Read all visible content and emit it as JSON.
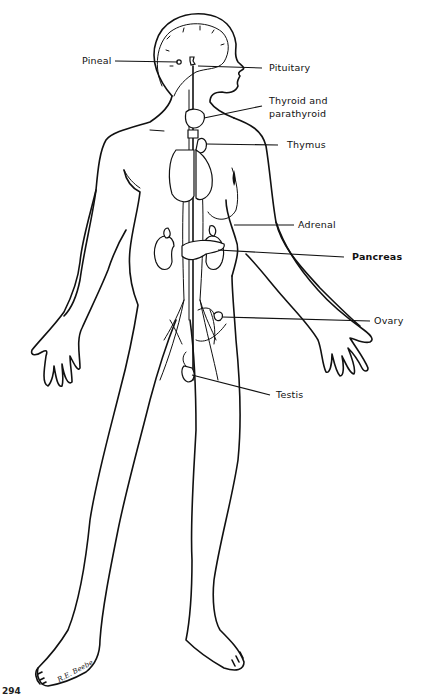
{
  "diagram": {
    "labels": [
      {
        "id": "pineal",
        "text": "Pineal",
        "side": "left"
      },
      {
        "id": "pituitary",
        "text": "Pituitary",
        "side": "right"
      },
      {
        "id": "thyroid",
        "text": "Thyroid and",
        "side": "right"
      },
      {
        "id": "thyroid2",
        "text": "parathyroid",
        "side": "right"
      },
      {
        "id": "thymus",
        "text": "Thymus",
        "side": "right"
      },
      {
        "id": "adrenal",
        "text": "Adrenal",
        "side": "right"
      },
      {
        "id": "pancreas",
        "text": "Pancreas",
        "side": "right"
      },
      {
        "id": "ovary",
        "text": "Ovary",
        "side": "right"
      },
      {
        "id": "testis",
        "text": "Testis",
        "side": "right"
      }
    ],
    "signature": "R.E. Beebe",
    "figure_code": "294"
  }
}
